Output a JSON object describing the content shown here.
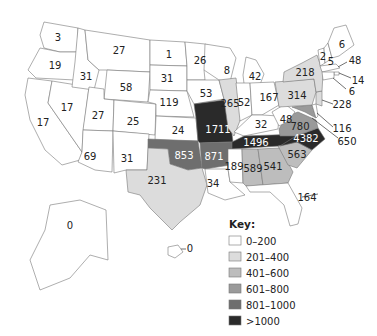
{
  "chart_data": {
    "type": "choropleth",
    "title": "",
    "legend": {
      "title": "Key:",
      "placement": "bottom-right",
      "bins": [
        {
          "label": "0–200",
          "min": 0,
          "max": 200,
          "color": "#ffffff"
        },
        {
          "label": "201–400",
          "min": 201,
          "max": 400,
          "color": "#dcdcdc"
        },
        {
          "label": "401–600",
          "min": 401,
          "max": 600,
          "color": "#bdbdbd"
        },
        {
          "label": "601–800",
          "min": 601,
          "max": 800,
          "color": "#9a9a9a"
        },
        {
          "label": "801–1000",
          "min": 801,
          "max": 1000,
          "color": "#6e6e6e"
        },
        {
          "label": ">1000",
          "min": 1001,
          "max": null,
          "color": "#2a2a2a"
        }
      ]
    },
    "regions": [
      {
        "name": "Washington",
        "value": 3
      },
      {
        "name": "Oregon",
        "value": 19
      },
      {
        "name": "California",
        "value": 17
      },
      {
        "name": "Nevada",
        "value": 17
      },
      {
        "name": "Idaho",
        "value": 31
      },
      {
        "name": "Montana",
        "value": 27
      },
      {
        "name": "Wyoming",
        "value": 58
      },
      {
        "name": "Utah",
        "value": 27
      },
      {
        "name": "Colorado",
        "value": 25
      },
      {
        "name": "Arizona",
        "value": 69
      },
      {
        "name": "New Mexico",
        "value": 31
      },
      {
        "name": "North Dakota",
        "value": 1
      },
      {
        "name": "South Dakota",
        "value": 31
      },
      {
        "name": "Nebraska",
        "value": 119
      },
      {
        "name": "Kansas",
        "value": 24
      },
      {
        "name": "Oklahoma",
        "value": 853
      },
      {
        "name": "Texas",
        "value": 231
      },
      {
        "name": "Minnesota",
        "value": 26
      },
      {
        "name": "Iowa",
        "value": 53
      },
      {
        "name": "Missouri",
        "value": 1711
      },
      {
        "name": "Arkansas",
        "value": 871
      },
      {
        "name": "Louisiana",
        "value": 34
      },
      {
        "name": "Wisconsin",
        "value": 8
      },
      {
        "name": "Illinois",
        "value": 265
      },
      {
        "name": "Michigan",
        "value": 42
      },
      {
        "name": "Indiana",
        "value": 52
      },
      {
        "name": "Ohio",
        "value": 167
      },
      {
        "name": "Kentucky",
        "value": 32
      },
      {
        "name": "Tennessee",
        "value": 1496
      },
      {
        "name": "Mississippi",
        "value": 189
      },
      {
        "name": "Alabama",
        "value": 589
      },
      {
        "name": "Georgia",
        "value": 541
      },
      {
        "name": "Florida",
        "value": 164
      },
      {
        "name": "South Carolina",
        "value": 563
      },
      {
        "name": "North Carolina",
        "value": 4382
      },
      {
        "name": "Virginia",
        "value": 780
      },
      {
        "name": "West Virginia",
        "value": 48
      },
      {
        "name": "Maryland",
        "value": 650
      },
      {
        "name": "Delaware",
        "value": 116
      },
      {
        "name": "New Jersey",
        "value": 228
      },
      {
        "name": "Pennsylvania",
        "value": 314
      },
      {
        "name": "New York",
        "value": 218
      },
      {
        "name": "Vermont",
        "value": 2
      },
      {
        "name": "New Hampshire",
        "value": 5
      },
      {
        "name": "Maine",
        "value": 6
      },
      {
        "name": "Massachusetts",
        "value": 48
      },
      {
        "name": "Rhode Island",
        "value": 14
      },
      {
        "name": "Connecticut",
        "value": 6
      },
      {
        "name": "Alaska",
        "value": 0
      },
      {
        "name": "Hawaii",
        "value": 0
      }
    ]
  }
}
